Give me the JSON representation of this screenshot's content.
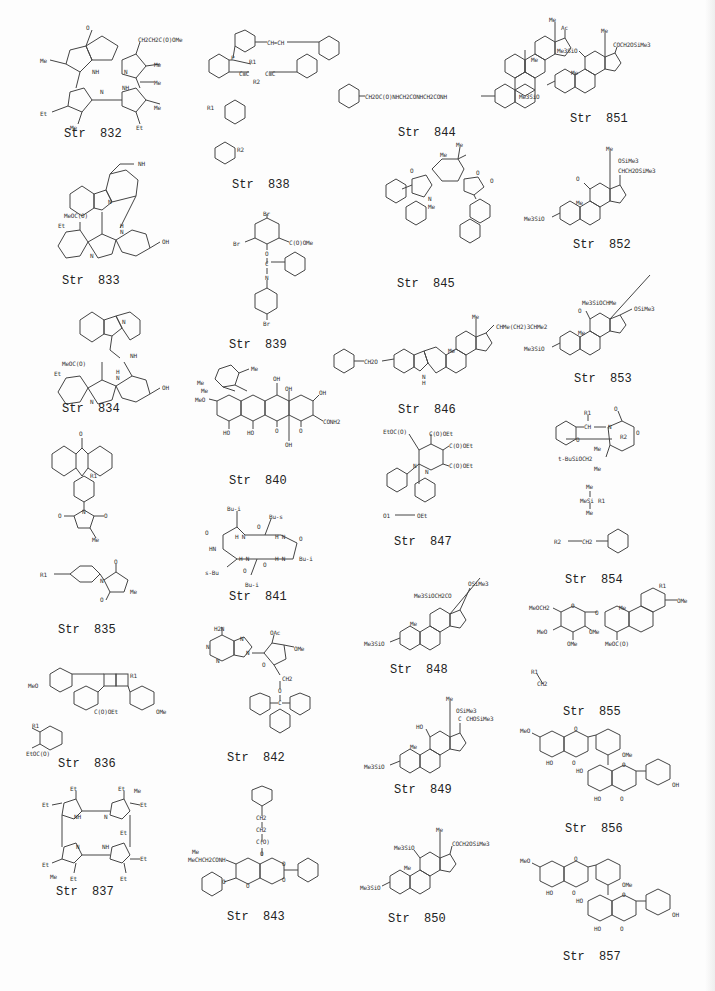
{
  "structures": [
    {
      "id": "832",
      "caption": "Str  832",
      "labels": [
        "O",
        "CH2CH2C(O)OMe",
        "Me",
        "NH",
        "N",
        "Me",
        "Me",
        "N",
        "NH",
        "Et",
        "Me",
        "Me",
        "Et"
      ]
    },
    {
      "id": "833",
      "caption": "Str  833",
      "labels": [
        "NH",
        "N",
        "MeOC(O)",
        "Et",
        "H",
        "N",
        "N",
        "OH"
      ]
    },
    {
      "id": "834",
      "caption": "Str  834",
      "labels": [
        "N",
        "NH",
        "MeOC(O)",
        "Et",
        "H",
        "N",
        "N",
        "OH"
      ]
    },
    {
      "id": "835",
      "caption": "Str  835",
      "labels": [
        "O",
        "R1",
        "N",
        "O",
        "O",
        "Me",
        "R1",
        "N",
        "O",
        "O",
        "Me"
      ]
    },
    {
      "id": "836",
      "caption": "Str  836",
      "labels": [
        "R1",
        "MeO",
        "C(O)OEt",
        "OMe",
        "R1",
        "EtOC(O)"
      ]
    },
    {
      "id": "837",
      "caption": "Str  837",
      "labels": [
        "Et",
        "Et",
        "Et",
        "Me",
        "Et",
        "NH",
        "N",
        "N",
        "NH",
        "Et",
        "Et",
        "Me",
        "Et",
        "Et",
        "Et"
      ]
    },
    {
      "id": "838",
      "caption": "Str  838",
      "labels": [
        "CH=CH",
        "P",
        "R1",
        "C≡C",
        "C≡C",
        "R2",
        "R1",
        "R2"
      ]
    },
    {
      "id": "839",
      "caption": "Str  839",
      "labels": [
        "Br",
        "Br",
        "C(O)OMe",
        "O",
        "C",
        "N",
        "Br"
      ]
    },
    {
      "id": "840",
      "caption": "Str  840",
      "labels": [
        "Me",
        "Me",
        "Me",
        "OH",
        "MeO",
        "OH",
        "OH",
        "CONH2",
        "HO",
        "HO",
        "O",
        "O",
        "OH"
      ]
    },
    {
      "id": "841",
      "caption": "Str  841",
      "labels": [
        "Bu-i",
        "Bu-s",
        "O",
        "O",
        "H N",
        "H N",
        "O",
        "HN",
        "H N",
        "O",
        "H N",
        "Bu-i",
        "s-Bu",
        "O",
        "Bu-i"
      ]
    },
    {
      "id": "842",
      "caption": "Str  842",
      "labels": [
        "H2N",
        "N",
        "N",
        "N",
        "N",
        "OAc",
        "OMe",
        "O",
        "CH2",
        "O",
        "C"
      ]
    },
    {
      "id": "843",
      "caption": "Str  843",
      "labels": [
        "CH2",
        "CH2",
        "C(O)",
        "O",
        "Me",
        "MeCHCH2CONH",
        "O",
        "O",
        "O",
        "O"
      ]
    },
    {
      "id": "844",
      "caption": "Str  844",
      "labels": [
        "Me",
        "Ac",
        "Me",
        "CH2OC(O)NHCH2CONHCH2CONH"
      ]
    },
    {
      "id": "845",
      "caption": "Str  845",
      "labels": [
        "Me",
        "Me",
        "O",
        "O",
        "O",
        "N",
        "Me"
      ]
    },
    {
      "id": "846",
      "caption": "Str  846",
      "labels": [
        "Me",
        "CHMe(CH2)3CHMe2",
        "Me",
        "CH2O",
        "N",
        "H"
      ]
    },
    {
      "id": "847",
      "caption": "Str  847",
      "labels": [
        "EtOC(O)",
        "C(O)OEt",
        "C(O)OEt",
        "C(O)OEt",
        "N",
        "N",
        "O1",
        "OEt"
      ]
    },
    {
      "id": "848",
      "caption": "Str  848",
      "labels": [
        "OSiMe3",
        "Me3SiOCH2CO",
        "Me",
        "Me3SiO"
      ]
    },
    {
      "id": "849",
      "caption": "Str  849",
      "labels": [
        "Me",
        "OSiMe3",
        "C",
        "CHOSiMe3",
        "HO",
        "Me",
        "Me3SiO"
      ]
    },
    {
      "id": "850",
      "caption": "Str  850",
      "labels": [
        "Me",
        "COCH2OSiMe3",
        "Me3SiO",
        "Me",
        "Me3SiO"
      ]
    },
    {
      "id": "851",
      "caption": "Str  851",
      "labels": [
        "Me",
        "COCH2OSiMe3",
        "Me3SiO",
        "Me",
        "Me3SiO"
      ]
    },
    {
      "id": "852",
      "caption": "Str  852",
      "labels": [
        "Me",
        "OSiMe3",
        "CHCH2OSiMe3",
        "O",
        "Me",
        "Me3SiO"
      ]
    },
    {
      "id": "853",
      "caption": "Str  853",
      "labels": [
        "Me3SiOCHMe",
        "OSiMe3",
        "O",
        "Me",
        "Me3SiO"
      ]
    },
    {
      "id": "854",
      "caption": "Str  854",
      "labels": [
        "R1",
        "CH",
        "N",
        "O",
        "R2",
        "O",
        "O",
        "Me",
        "t-BuSiOCH2",
        "Me",
        "Me",
        "MeSi",
        "R1",
        "Me",
        "R2",
        "CH2"
      ]
    },
    {
      "id": "855",
      "caption": "Str  855",
      "labels": [
        "R1",
        "OMe",
        "MeOCH2",
        "O",
        "O",
        "Me",
        "MeO",
        "OMe",
        "OMe",
        "MeOC(O)",
        "R1",
        "CH2"
      ]
    },
    {
      "id": "856",
      "caption": "Str  856",
      "labels": [
        "MeO",
        "O",
        "OMe",
        "HO",
        "O",
        "HO",
        "O",
        "OH",
        "HO",
        "O"
      ]
    },
    {
      "id": "857",
      "caption": "Str  857",
      "labels": [
        "MeO",
        "O",
        "OMe",
        "HO",
        "O",
        "HO",
        "O",
        "OH",
        "HO",
        "O"
      ]
    }
  ]
}
